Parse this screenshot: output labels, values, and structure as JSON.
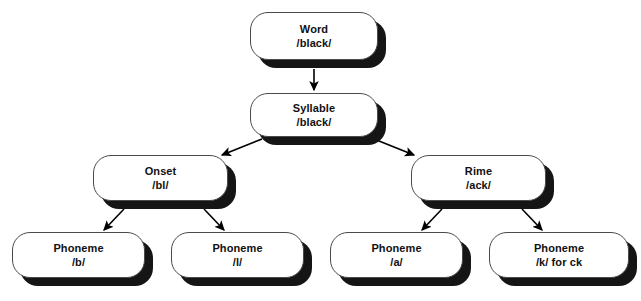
{
  "diagram": {
    "background_color": "#ffffff",
    "node_fill_color": "#ffffff",
    "node_border_color": "#4a4a4a",
    "shadow_color": "#151515",
    "connector_color": "#000000",
    "nodes": [
      {
        "id": "word",
        "label": "Word",
        "value": "/black/",
        "x": 250,
        "y": 12,
        "width": 128,
        "height": 48
      },
      {
        "id": "syllable",
        "label": "Syllable",
        "value": "/black/",
        "x": 250,
        "y": 93,
        "width": 128,
        "height": 44
      },
      {
        "id": "onset",
        "label": "Onset",
        "value": "/bl/",
        "x": 93,
        "y": 155,
        "width": 135,
        "height": 46
      },
      {
        "id": "rime",
        "label": "Rime",
        "value": "/ack/",
        "x": 411,
        "y": 155,
        "width": 135,
        "height": 46
      },
      {
        "id": "phoneme-b",
        "label": "Phoneme",
        "value": "/b/",
        "x": 12,
        "y": 232,
        "width": 133,
        "height": 46
      },
      {
        "id": "phoneme-l",
        "label": "Phoneme",
        "value": "/l/",
        "x": 171,
        "y": 232,
        "width": 133,
        "height": 46
      },
      {
        "id": "phoneme-a",
        "label": "Phoneme",
        "value": "/a/",
        "x": 330,
        "y": 232,
        "width": 133,
        "height": 46
      },
      {
        "id": "phoneme-k",
        "label": "Phoneme",
        "value": "/k/ for ck",
        "x": 489,
        "y": 232,
        "width": 140,
        "height": 46
      }
    ],
    "edges": [
      {
        "id": "word-to-syllable",
        "from": "word",
        "to": "syllable"
      },
      {
        "id": "syllable-to-onset",
        "from": "syllable",
        "to": "onset"
      },
      {
        "id": "syllable-to-rime",
        "from": "syllable",
        "to": "rime"
      },
      {
        "id": "onset-to-phoneme-b",
        "from": "onset",
        "to": "phoneme-b"
      },
      {
        "id": "onset-to-phoneme-l",
        "from": "onset",
        "to": "phoneme-l"
      },
      {
        "id": "rime-to-phoneme-a",
        "from": "rime",
        "to": "phoneme-a"
      },
      {
        "id": "rime-to-phoneme-k",
        "from": "rime",
        "to": "phoneme-k"
      }
    ]
  }
}
